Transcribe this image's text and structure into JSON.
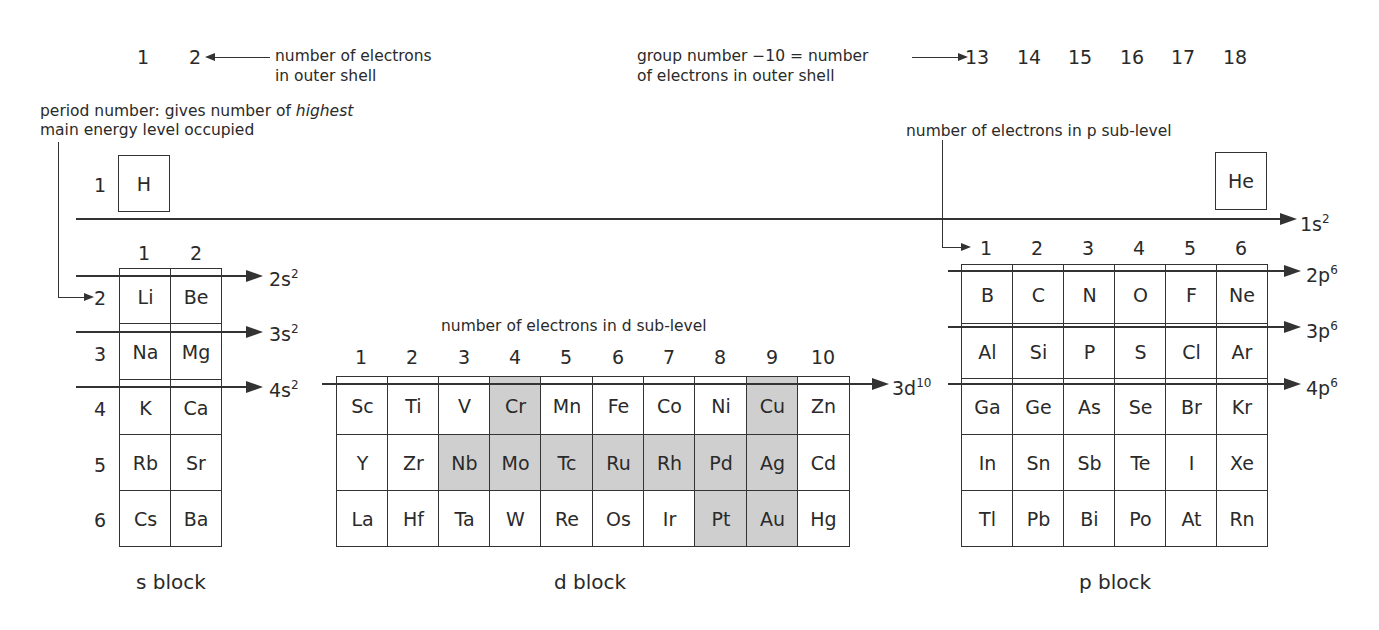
{
  "annotations": {
    "outer_shell_groups": [
      "1",
      "2"
    ],
    "outer_shell_label_line1": "number of electrons",
    "outer_shell_label_line2": "in outer shell",
    "group_rule_line1": "group number −10 = number",
    "group_rule_line2": "of electrons in outer shell",
    "p_groups": [
      "13",
      "14",
      "15",
      "16",
      "17",
      "18"
    ],
    "period_label_line1_pre": "period number: gives number of ",
    "period_label_line1_em": "highest",
    "period_label_line2": "main energy level occupied",
    "p_sublevel_label": "number of electrons in p sub-level",
    "d_sublevel_label": "number of electrons in d sub-level"
  },
  "period1": {
    "period_number": "1",
    "h": "H",
    "he": "He",
    "sublevel": {
      "base": "1s",
      "sup": "2"
    }
  },
  "s_block": {
    "label": "s block",
    "column_numbers": [
      "1",
      "2"
    ],
    "periods": [
      "2",
      "3",
      "4",
      "5",
      "6"
    ],
    "rows": [
      [
        "Li",
        "Be"
      ],
      [
        "Na",
        "Mg"
      ],
      [
        "K",
        "Ca"
      ],
      [
        "Rb",
        "Sr"
      ],
      [
        "Cs",
        "Ba"
      ]
    ],
    "sublevels": [
      {
        "base": "2s",
        "sup": "2"
      },
      {
        "base": "3s",
        "sup": "2"
      },
      {
        "base": "4s",
        "sup": "2"
      }
    ]
  },
  "d_block": {
    "label": "d block",
    "column_numbers": [
      "1",
      "2",
      "3",
      "4",
      "5",
      "6",
      "7",
      "8",
      "9",
      "10"
    ],
    "rows": [
      [
        "Sc",
        "Ti",
        "V",
        "Cr",
        "Mn",
        "Fe",
        "Co",
        "Ni",
        "Cu",
        "Zn"
      ],
      [
        "Y",
        "Zr",
        "Nb",
        "Mo",
        "Tc",
        "Ru",
        "Rh",
        "Pd",
        "Ag",
        "Cd"
      ],
      [
        "La",
        "Hf",
        "Ta",
        "W",
        "Re",
        "Os",
        "Ir",
        "Pt",
        "Au",
        "Hg"
      ]
    ],
    "shaded": [
      "Cr",
      "Cu",
      "Nb",
      "Mo",
      "Tc",
      "Ru",
      "Rh",
      "Pd",
      "Ag",
      "Pt",
      "Au"
    ],
    "sublevel": {
      "base": "3d",
      "sup": "10"
    }
  },
  "p_block": {
    "label": "p block",
    "column_numbers": [
      "1",
      "2",
      "3",
      "4",
      "5",
      "6"
    ],
    "rows": [
      [
        "B",
        "C",
        "N",
        "O",
        "F",
        "Ne"
      ],
      [
        "Al",
        "Si",
        "P",
        "S",
        "Cl",
        "Ar"
      ],
      [
        "Ga",
        "Ge",
        "As",
        "Se",
        "Br",
        "Kr"
      ],
      [
        "In",
        "Sn",
        "Sb",
        "Te",
        "I",
        "Xe"
      ],
      [
        "Tl",
        "Pb",
        "Bi",
        "Po",
        "At",
        "Rn"
      ]
    ],
    "sublevels": [
      {
        "base": "2p",
        "sup": "6"
      },
      {
        "base": "3p",
        "sup": "6"
      },
      {
        "base": "4p",
        "sup": "6"
      }
    ]
  },
  "colors": {
    "line": "#333333",
    "text": "#2a2a2a",
    "shaded_cell": "#cfcfcf",
    "background": "#ffffff"
  }
}
